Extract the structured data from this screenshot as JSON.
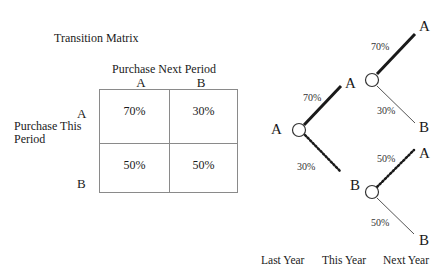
{
  "matrix": {
    "title": "Transition Matrix",
    "column_header": "Purchase Next Period",
    "row_header": "Purchase This Period",
    "columns": [
      "A",
      "B"
    ],
    "rows": [
      {
        "label": "A",
        "cells": [
          "70%",
          "30%"
        ]
      },
      {
        "label": "B",
        "cells": [
          "50%",
          "50%"
        ]
      }
    ]
  },
  "tree": {
    "root": {
      "label": "A"
    },
    "level1": [
      {
        "label": "A",
        "prob": "70%",
        "style": "solid-thick"
      },
      {
        "label": "B",
        "prob": "30%",
        "style": "dotted"
      }
    ],
    "level2_from_A": [
      {
        "label": "A",
        "prob": "70%",
        "style": "solid-thick"
      },
      {
        "label": "B",
        "prob": "30%",
        "style": "solid-thin"
      }
    ],
    "level2_from_B": [
      {
        "label": "A",
        "prob": "50%",
        "style": "dotted"
      },
      {
        "label": "B",
        "prob": "50%",
        "style": "solid-thin"
      }
    ],
    "timeline": [
      "Last Year",
      "This Year",
      "Next Year"
    ]
  },
  "colors": {
    "text": "#1a1a1a",
    "grid": "#8a8a8a",
    "thin_line": "#555555",
    "thick_line": "#1a1a1a"
  }
}
